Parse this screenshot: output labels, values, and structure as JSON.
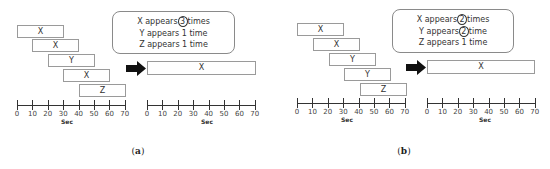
{
  "figure": {
    "panels": [
      {
        "caption_open": "(",
        "caption_letter": "a",
        "caption_close": ")",
        "segments": [
          {
            "label": "X",
            "start": 0,
            "end": 30
          },
          {
            "label": "X",
            "start": 10,
            "end": 40
          },
          {
            "label": "Y",
            "start": 20,
            "end": 50
          },
          {
            "label": "X",
            "start": 30,
            "end": 60
          },
          {
            "label": "Z",
            "start": 40,
            "end": 70
          }
        ],
        "callout": {
          "line1_pre": "X appears",
          "line1_count": "3",
          "line1_post": "times",
          "line2": "Y appears 1 time",
          "line3": "Z appears 1 time"
        },
        "result": {
          "label": "X",
          "start": 0,
          "end": 70
        }
      },
      {
        "caption_open": "(",
        "caption_letter": "b",
        "caption_close": ")",
        "segments": [
          {
            "label": "X",
            "start": 0,
            "end": 30
          },
          {
            "label": "X",
            "start": 10,
            "end": 40
          },
          {
            "label": "Y",
            "start": 20,
            "end": 50
          },
          {
            "label": "Y",
            "start": 30,
            "end": 60
          },
          {
            "label": "Z",
            "start": 40,
            "end": 70
          }
        ],
        "callout": {
          "line1_pre": "X appears",
          "line1_count": "2",
          "line1_post": "times",
          "line2_pre": "Y appears",
          "line2_count": "2",
          "line2_post": "time",
          "line3": "Z appears 1 time"
        },
        "result": {
          "label": "X",
          "start": 0,
          "end": 70
        }
      }
    ],
    "axis": {
      "ticks": [
        "0",
        "10",
        "20",
        "30",
        "40",
        "50",
        "60",
        "70"
      ],
      "label": "Sec",
      "min": 0,
      "max": 70
    },
    "colors": {
      "box_border": "#9a9a9a",
      "text": "#333333",
      "arrow": "#111111",
      "background": "#ffffff"
    }
  }
}
